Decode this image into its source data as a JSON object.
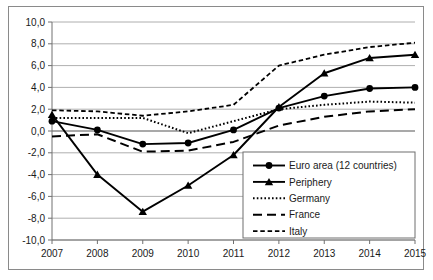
{
  "chart_data": {
    "type": "line",
    "title": "",
    "subtitle": "",
    "xlabel": "",
    "ylabel": "",
    "categories": [
      "2007",
      "2008",
      "2009",
      "2010",
      "2011",
      "2012",
      "2013",
      "2014",
      "2015"
    ],
    "x_tick_labels": [
      "2007",
      "2008",
      "2009",
      "2010",
      "2011",
      "2012",
      "2013",
      "2014",
      "2015"
    ],
    "y_tick_labels": [
      "10,0",
      "8,0",
      "6,0",
      "4,0",
      "2,0",
      "0,0",
      "-2,0",
      "-4,0",
      "-6,0",
      "-8,0",
      "-10,0"
    ],
    "y_tick_values": [
      10,
      8,
      6,
      4,
      2,
      0,
      -2,
      -4,
      -6,
      -8,
      -10
    ],
    "ylim": [
      -10,
      10
    ],
    "grid": true,
    "grid_axis": "y",
    "legend_position": "bottom-right",
    "decimal_separator": ",",
    "series": [
      {
        "name": "Euro area (12 countries)",
        "marker": "circle",
        "line_style": "solid",
        "color": "#000000",
        "values": [
          0.9,
          0.1,
          -1.2,
          -1.1,
          0.1,
          2.1,
          3.2,
          3.9,
          4.0
        ]
      },
      {
        "name": "Periphery",
        "marker": "triangle",
        "line_style": "solid",
        "color": "#000000",
        "values": [
          1.5,
          -4.0,
          -7.4,
          -5.0,
          -2.2,
          2.2,
          5.3,
          6.7,
          7.0
        ]
      },
      {
        "name": "Germany",
        "marker": "none",
        "line_style": "dotted",
        "color": "#000000",
        "values": [
          1.2,
          1.2,
          1.2,
          -0.2,
          0.9,
          2.0,
          2.4,
          2.7,
          2.6
        ]
      },
      {
        "name": "France",
        "marker": "none",
        "line_style": "dashed-long",
        "color": "#000000",
        "values": [
          -0.5,
          -0.3,
          -1.9,
          -1.8,
          -1.0,
          0.5,
          1.3,
          1.8,
          2.0
        ]
      },
      {
        "name": "Italy",
        "marker": "none",
        "line_style": "dashed-short",
        "color": "#000000",
        "values": [
          1.9,
          1.8,
          1.4,
          1.8,
          2.4,
          6.0,
          7.0,
          7.7,
          8.1
        ]
      }
    ]
  },
  "legend": {
    "items": [
      {
        "label": "Euro area (12 countries)"
      },
      {
        "label": "Periphery"
      },
      {
        "label": "Germany"
      },
      {
        "label": "France"
      },
      {
        "label": "Italy"
      }
    ]
  }
}
